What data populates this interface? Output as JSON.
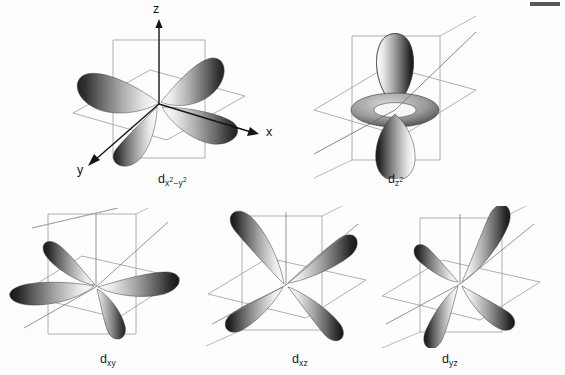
{
  "figure": {
    "background_color": "#fdfdfd",
    "width": 565,
    "height": 375
  },
  "axes": {
    "z_label": "z",
    "x_label": "x",
    "y_label": "y"
  },
  "corner_mark": {
    "name": "page-edge-mark",
    "color": "#555a5e"
  },
  "orbitals": [
    {
      "id": "dx2-y2",
      "base": "d",
      "sub_pre": "x",
      "sub_pre_sup": "2",
      "sub_mid": "−y",
      "sub_post_sup": "2",
      "label_plain": "dx²−y²",
      "row": 1,
      "col": 1,
      "lobe_count": 4,
      "orientation": "lobes along x and y axes",
      "has_torus": false
    },
    {
      "id": "dz2",
      "base": "d",
      "sub_pre": "z",
      "sub_pre_sup": "2",
      "sub_mid": "",
      "sub_post_sup": "",
      "label_plain": "dz²",
      "row": 1,
      "col": 2,
      "lobe_count": 2,
      "orientation": "lobes along z axis with equatorial torus",
      "has_torus": true
    },
    {
      "id": "dxy",
      "base": "d",
      "sub_pre": "xy",
      "sub_pre_sup": "",
      "sub_mid": "",
      "sub_post_sup": "",
      "label_plain": "dxy",
      "row": 2,
      "col": 1,
      "lobe_count": 4,
      "orientation": "lobes between x and y axes",
      "has_torus": false
    },
    {
      "id": "dxz",
      "base": "d",
      "sub_pre": "xz",
      "sub_pre_sup": "",
      "sub_mid": "",
      "sub_post_sup": "",
      "label_plain": "dxz",
      "row": 2,
      "col": 2,
      "lobe_count": 4,
      "orientation": "lobes between x and z axes",
      "has_torus": false
    },
    {
      "id": "dyz",
      "base": "d",
      "sub_pre": "yz",
      "sub_pre_sup": "",
      "sub_mid": "",
      "sub_post_sup": "",
      "label_plain": "dyz",
      "row": 2,
      "col": 3,
      "lobe_count": 4,
      "orientation": "lobes between y and z axes",
      "has_torus": false
    }
  ],
  "style": {
    "plane_stroke": "#9a9a9a",
    "axis_stroke": "#1a1a1a",
    "lobe_dark": "#2b2b2b",
    "lobe_mid": "#8a8a8a",
    "lobe_light": "#f2f2f2",
    "label_color": "#1a1a1a"
  }
}
